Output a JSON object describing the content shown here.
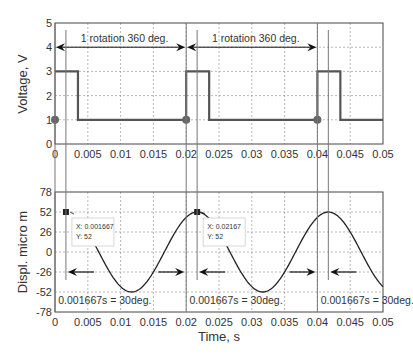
{
  "chart_data": [
    {
      "type": "line",
      "title": "",
      "xlabel": "",
      "ylabel": "Voltage, V",
      "xlim": [
        0,
        0.05
      ],
      "ylim": [
        0,
        5
      ],
      "grid": true,
      "xticks": [
        0,
        0.005,
        0.01,
        0.015,
        0.02,
        0.025,
        0.03,
        0.035,
        0.04,
        0.045,
        0.05
      ],
      "xtick_labels": [
        "0",
        "0.005",
        "0.01",
        "0.015",
        "0.02",
        "0.025",
        "0.03",
        "0.035",
        "0.04",
        "0.045",
        "0.05"
      ],
      "yticks": [
        0,
        1,
        2,
        3,
        4,
        5
      ],
      "ytick_labels": [
        "0",
        "1",
        "2",
        "3",
        "4",
        "5"
      ],
      "series": [
        {
          "name": "Voltage pulse",
          "x": [
            0,
            0.0035,
            0.0035,
            0.02,
            0.02,
            0.0235,
            0.0235,
            0.04,
            0.04,
            0.0435,
            0.0435,
            0.05
          ],
          "y": [
            3,
            3,
            1,
            1,
            3,
            3,
            1,
            1,
            3,
            3,
            1,
            1
          ]
        }
      ],
      "markers": [
        {
          "x": 0,
          "y": 1
        },
        {
          "x": 0.02,
          "y": 1
        },
        {
          "x": 0.04,
          "y": 1
        }
      ],
      "annotations": [
        {
          "text": "1 rotation 360 deg.",
          "x_from": 0,
          "x_to": 0.02,
          "y": 4
        },
        {
          "text": "1 rotation 360 deg.",
          "x_from": 0.02,
          "x_to": 0.04,
          "y": 4
        }
      ]
    },
    {
      "type": "line",
      "title": "",
      "xlabel": "Time, s",
      "ylabel": "Displ. micro m",
      "xlim": [
        0,
        0.05
      ],
      "ylim": [
        -78,
        78
      ],
      "grid": true,
      "xticks": [
        0,
        0.005,
        0.01,
        0.015,
        0.02,
        0.025,
        0.03,
        0.035,
        0.04,
        0.045,
        0.05
      ],
      "xtick_labels": [
        "0",
        "0.005",
        "0.01",
        "0.015",
        "0.02",
        "0.025",
        "0.03",
        "0.035",
        "0.04",
        "0.045",
        "0.05"
      ],
      "yticks": [
        78,
        52,
        26,
        0,
        -26,
        -52,
        -78
      ],
      "ytick_labels": [
        "78",
        "52",
        "26",
        "0",
        "-26",
        "-52",
        "-78"
      ],
      "series": [
        {
          "name": "Displacement",
          "function": "52*cos(2*pi*(t-0.001667)/0.02)",
          "amplitude": 52,
          "period": 0.02,
          "phase_shift": 0.001667,
          "x_start": 0.0058,
          "x_end": 0.05
        }
      ],
      "datatips": [
        {
          "x_label": "X: 0.001667",
          "y_label": "Y: 52",
          "x": 0.001667,
          "y": 52
        },
        {
          "x_label": "X: 0.02167",
          "y_label": "Y: 52",
          "x": 0.02167,
          "y": 52
        }
      ],
      "annotations": [
        {
          "text": "0.001667s = 30deg.",
          "x": 0.0005,
          "y": -62
        },
        {
          "text": "0.001667s = 30deg.",
          "x": 0.0205,
          "y": -62
        },
        {
          "text": "0.001667s = 30deg.",
          "x": 0.0405,
          "y": -62
        }
      ],
      "vertical_lines": [
        0,
        0.001667,
        0.02,
        0.021667,
        0.04,
        0.041667
      ]
    }
  ],
  "labels": {
    "top_ylabel": "Voltage, V",
    "bottom_ylabel": "Displ. micro m",
    "bottom_xlabel": "Time, s"
  }
}
